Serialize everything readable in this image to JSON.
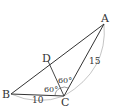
{
  "diagram": {
    "type": "geometry-triangle",
    "points": {
      "A": {
        "label": "A",
        "x": 104,
        "y": 24,
        "lx": 101,
        "ly": 22
      },
      "B": {
        "label": "B",
        "x": 11,
        "y": 94,
        "lx": 2,
        "ly": 97
      },
      "C": {
        "label": "C",
        "x": 64,
        "y": 96,
        "lx": 61,
        "ly": 106
      },
      "D": {
        "label": "D",
        "x": 48,
        "y": 61,
        "lx": 42,
        "ly": 60
      }
    },
    "segments": [
      {
        "from": "A",
        "to": "B"
      },
      {
        "from": "B",
        "to": "C"
      },
      {
        "from": "C",
        "to": "A"
      },
      {
        "from": "C",
        "to": "D"
      }
    ],
    "measures": {
      "AC": {
        "text": "15",
        "x": 89,
        "y": 64
      },
      "BC": {
        "text": "10",
        "x": 32,
        "y": 102
      }
    },
    "angles": {
      "BCD": {
        "text": "60°",
        "x": 44,
        "y": 91
      },
      "DCA": {
        "text": "60°",
        "x": 58,
        "y": 81
      }
    },
    "colors": {
      "line": "#333333",
      "arc": "#999999"
    }
  }
}
